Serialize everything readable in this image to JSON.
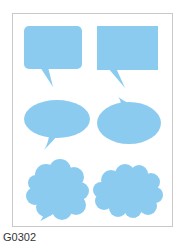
{
  "product": {
    "code": "G0302",
    "sheet_color": "#ffffff",
    "border_color": "#c9c9c9",
    "bubble_color": "#8ccbf0"
  },
  "bubbles": [
    {
      "shape": "rounded-rectangle-speech-bubble",
      "tail": "bottom-left"
    },
    {
      "shape": "rectangle-speech-bubble",
      "tail": "bottom-left"
    },
    {
      "shape": "oval-speech-bubble",
      "tail": "bottom-left"
    },
    {
      "shape": "oval-speech-bubble",
      "tail": "top-left"
    },
    {
      "shape": "cloud-thought-bubble",
      "tail": "bottom-left"
    },
    {
      "shape": "cloud-thought-bubble",
      "tail": "bottom-right"
    }
  ]
}
